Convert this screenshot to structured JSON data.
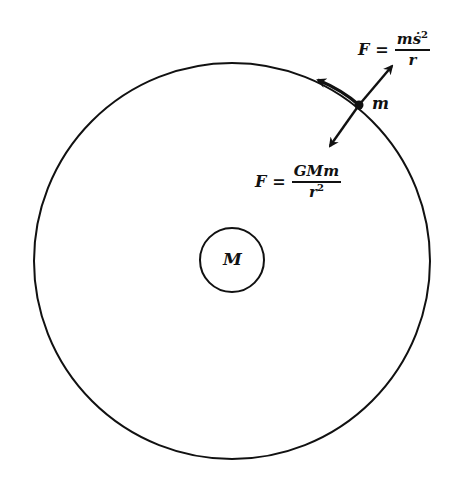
{
  "diagram": {
    "central_body": {
      "label": "M",
      "center": [
        232,
        260
      ],
      "radius": 32
    },
    "orbit": {
      "center": [
        232,
        261
      ],
      "radius": 198
    },
    "orbiting_body": {
      "label": "m",
      "position": [
        359,
        105
      ]
    },
    "centrifugal_force": {
      "lhs": "F",
      "eq": "=",
      "numerator_base": "mṡ",
      "numerator_exp": "2",
      "denominator": "r",
      "direction": "outward"
    },
    "gravitational_force": {
      "lhs": "F",
      "eq": "=",
      "numerator": "GMm",
      "denominator_base": "r",
      "denominator_exp": "2",
      "direction": "inward"
    },
    "velocity_arrow": {
      "direction": "tangential counterclockwise"
    },
    "colors": {
      "stroke": "#111111",
      "background": "#ffffff"
    }
  }
}
